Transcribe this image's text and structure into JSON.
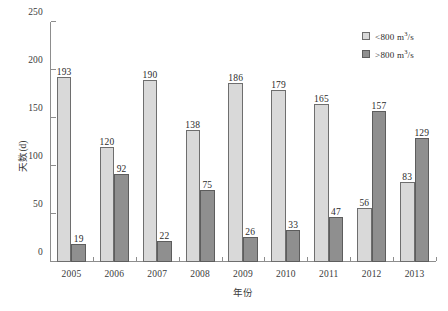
{
  "chart_data": {
    "type": "bar",
    "title": "",
    "xlabel": "年份",
    "ylabel": "天数(d)",
    "ylim": [
      0,
      250
    ],
    "ytick_step": 50,
    "yticks": [
      0,
      50,
      100,
      150,
      200,
      250
    ],
    "grid": false,
    "legend_position": "top-right",
    "categories": [
      "2005",
      "2006",
      "2007",
      "2008",
      "2009",
      "2010",
      "2011",
      "2012",
      "2013"
    ],
    "series": [
      {
        "name": "< 800 m3/s",
        "label_prefix": "<",
        "label_value": "800",
        "label_unit": "m",
        "label_exp": "3",
        "label_denom": "/s",
        "color": "#d9d9d9",
        "values": [
          193,
          120,
          190,
          138,
          186,
          179,
          165,
          56,
          83
        ]
      },
      {
        "name": "> 800 m3/s",
        "label_prefix": ">",
        "label_value": "800",
        "label_unit": "m",
        "label_exp": "3",
        "label_denom": "/s",
        "color": "#8f8f8f",
        "values": [
          19,
          92,
          22,
          75,
          26,
          33,
          47,
          157,
          129
        ]
      }
    ]
  }
}
